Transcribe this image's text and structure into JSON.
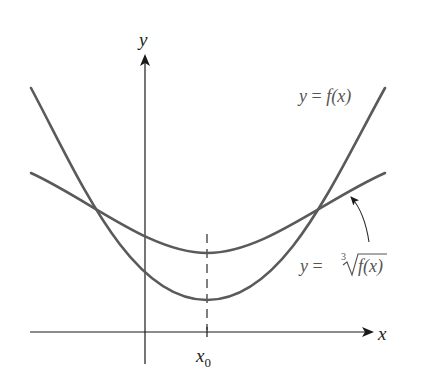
{
  "figure": {
    "axes": {
      "x_label": "x",
      "y_label": "y",
      "x_tick_label": "x",
      "x_tick_subscript": "0"
    },
    "curves": [
      {
        "name": "f",
        "label_prefix": "y = ",
        "label_func": "f(x)",
        "shape": "parabola, minimum at x0"
      },
      {
        "name": "cube-root-f",
        "label_prefix": "y = ",
        "radical_index": "3",
        "label_func": "f(x)",
        "shape": "flatter parabola-like curve, minimum at x0, above f near minimum"
      }
    ],
    "annotation": {
      "description": "curved arrow pointing from cube-root label to its curve"
    },
    "colors": {
      "axis": "#1a1a1a",
      "curve": "#5a5a5a",
      "label": "#555555"
    }
  }
}
